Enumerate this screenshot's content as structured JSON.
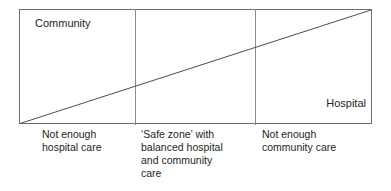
{
  "figure": {
    "type": "diagram",
    "box": {
      "axis_corner_labels": {
        "top_left": "Community",
        "bottom_right": "Hospital"
      },
      "trend_line": {
        "name": "balance-of-care-diagonal",
        "from": "bottom-left",
        "to": "top-right"
      },
      "zone_count": 3
    },
    "zones": [
      {
        "id": "zone-not-enough-hospital-care",
        "caption_lines": [
          "Not enough",
          "hospital care"
        ]
      },
      {
        "id": "zone-safe",
        "caption_lines": [
          "‘Safe zone’ with",
          "balanced hospital",
          "and community",
          "care"
        ]
      },
      {
        "id": "zone-not-enough-community-care",
        "caption_lines": [
          "Not enough",
          "community care"
        ]
      }
    ],
    "colors": {
      "border": "#6d6e71",
      "divider": "#8a8c8e",
      "line": "#4d4d4f",
      "text": "#231f20",
      "background": "#ffffff"
    }
  }
}
